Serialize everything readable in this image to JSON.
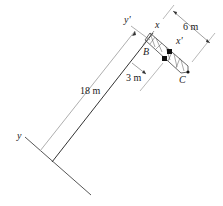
{
  "diagram": {
    "type": "engineering-mechanics-figure",
    "labels": {
      "y_axis": "y",
      "y_prime_axis": "y'",
      "x_axis": "x",
      "x_prime_axis": "x'",
      "point_b": "B",
      "point_c": "C"
    },
    "dimensions": {
      "tower_height": "18 m",
      "offset": "3 m",
      "boom_length": "6 m"
    },
    "colors": {
      "line": "#333333",
      "dimension_line": "#999999",
      "fill_dark": "#111111"
    }
  }
}
